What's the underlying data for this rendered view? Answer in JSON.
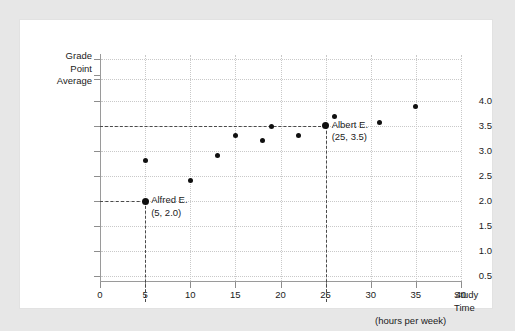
{
  "chart_data": {
    "type": "scatter",
    "title": "",
    "xlabel": "Study Time (hours per week)",
    "xlabel_lines": [
      "Study",
      "Time",
      "(hours per week)"
    ],
    "ylabel": "Grade Point Average",
    "ylabel_lines": [
      "Grade",
      "Point",
      "Average"
    ],
    "xlim": [
      0,
      40
    ],
    "ylim": [
      0,
      4.25
    ],
    "grid": true,
    "legend": "none",
    "xticks": [
      0,
      5,
      10,
      15,
      20,
      25,
      30,
      35,
      40
    ],
    "xtick_labels": [
      "0",
      "5",
      "10",
      "15",
      "20",
      "25",
      "30",
      "35",
      "40"
    ],
    "yticks": [
      0.5,
      1.0,
      1.5,
      2.0,
      2.5,
      3.0,
      3.5,
      4.0
    ],
    "ytick_labels": [
      "0.5",
      "1.0",
      "1.5",
      "2.0",
      "2.5",
      "3.0",
      "3.5",
      "4.0"
    ],
    "points": [
      {
        "x": 5,
        "y": 2.0,
        "highlight": true
      },
      {
        "x": 5,
        "y": 2.8,
        "highlight": false
      },
      {
        "x": 10,
        "y": 2.4,
        "highlight": false
      },
      {
        "x": 13,
        "y": 2.9,
        "highlight": false
      },
      {
        "x": 15,
        "y": 3.3,
        "highlight": false
      },
      {
        "x": 18,
        "y": 3.2,
        "highlight": false
      },
      {
        "x": 19,
        "y": 3.48,
        "highlight": false
      },
      {
        "x": 22,
        "y": 3.3,
        "highlight": false
      },
      {
        "x": 25,
        "y": 3.5,
        "highlight": true
      },
      {
        "x": 26,
        "y": 3.68,
        "highlight": false
      },
      {
        "x": 31,
        "y": 3.57,
        "highlight": false
      },
      {
        "x": 35,
        "y": 3.88,
        "highlight": false
      }
    ],
    "reference_lines": [
      {
        "axis": "y",
        "value": 2.0,
        "from_x": 0,
        "to_x": 5
      },
      {
        "axis": "y",
        "value": 3.5,
        "from_x": 0,
        "to_x": 25
      },
      {
        "axis": "x",
        "value": 5,
        "from_y": 0,
        "to_y": 2.0
      },
      {
        "axis": "x",
        "value": 25,
        "from_y": 0,
        "to_y": 3.5
      }
    ],
    "annotations": [
      {
        "name": "Alfred E.",
        "coords": "(5, 2.0)",
        "x": 5,
        "y": 2.0
      },
      {
        "name": "Albert E.",
        "coords": "(25, 3.5)",
        "x": 25,
        "y": 3.5
      }
    ],
    "colors": {
      "point": "#101010",
      "gridline": "#c9c9c9",
      "axis": "#9a9a9a",
      "reference_line": "#4a4a4a",
      "panel_background": "#ffffff",
      "page_background": "#e7e7e7",
      "text": "#1b1b1b"
    }
  }
}
